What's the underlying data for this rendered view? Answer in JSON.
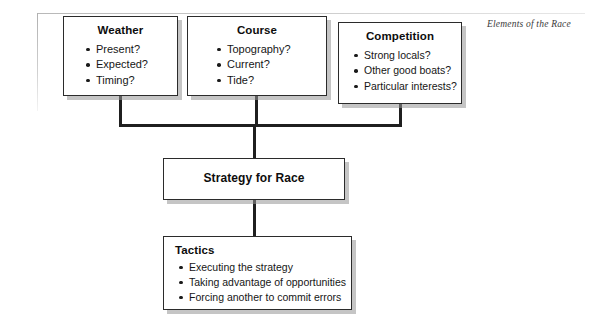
{
  "caption": "Elements of the Race",
  "colors": {
    "box_border": "#2b2b2b",
    "box_fill": "#ffffff",
    "connector": "#1f1f1f",
    "shadow": "#969696",
    "text": "#111111",
    "caption_text": "#3a3a3a"
  },
  "nodes": {
    "weather": {
      "title": "Weather",
      "items": [
        "Present?",
        "Expected?",
        "Timing?"
      ]
    },
    "course": {
      "title": "Course",
      "items": [
        "Topography?",
        "Current?",
        "Tide?"
      ]
    },
    "competition": {
      "title": "Competition",
      "items": [
        "Strong locals?",
        "Other good boats?",
        "Particular interests?"
      ]
    },
    "strategy": {
      "title": "Strategy for Race",
      "items": []
    },
    "tactics": {
      "title": "Tactics",
      "items": [
        "Executing the strategy",
        "Taking advantage of opportunities",
        "Forcing another to commit errors"
      ]
    }
  }
}
